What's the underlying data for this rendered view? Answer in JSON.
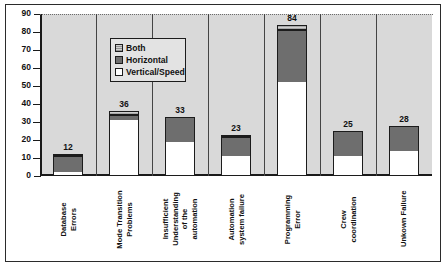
{
  "chart_data": {
    "type": "bar",
    "title": "",
    "subtitle": "",
    "xlabel": "",
    "ylabel": "",
    "ylim": [
      0,
      90
    ],
    "yticks": [
      0,
      10,
      20,
      30,
      40,
      50,
      60,
      70,
      80,
      90
    ],
    "grid": "dotted gridline at y=90 only",
    "stacked": true,
    "legend_position": "upper-left-inside",
    "categories": [
      "Database\nErrors",
      "Mode Transition\nProblems",
      "Insufficient\nUnderstanding\nof the\nautomation",
      "Automation\nsystem failure",
      "Programming\nError",
      "Crew\ncoordination",
      "Unkown Failure"
    ],
    "series": [
      {
        "name": "Vertical/Speed",
        "color": "#ffffff",
        "values": [
          2,
          31,
          19,
          11,
          52,
          11,
          14
        ]
      },
      {
        "name": "Horizontal",
        "color": "#6e6e6e",
        "values": [
          9,
          3,
          14,
          11,
          29,
          14,
          14
        ]
      },
      {
        "name": "Both",
        "color": "#cfcfcf",
        "values": [
          1,
          2,
          0,
          1,
          3,
          0,
          0
        ]
      }
    ],
    "totals": [
      12,
      36,
      33,
      23,
      84,
      25,
      28
    ],
    "data_labels": [
      "12",
      "36",
      "33",
      "23",
      "84",
      "25",
      "28"
    ]
  },
  "legend": {
    "items": [
      {
        "label": "Both",
        "swatch": "both"
      },
      {
        "label": "Horizontal",
        "swatch": "horizontal"
      },
      {
        "label": "Vertical/Speed",
        "swatch": "vertical"
      }
    ]
  },
  "axis": {
    "y_tick_labels": [
      "90",
      "80",
      "70",
      "60",
      "50",
      "40",
      "30",
      "20",
      "10",
      "0"
    ]
  }
}
